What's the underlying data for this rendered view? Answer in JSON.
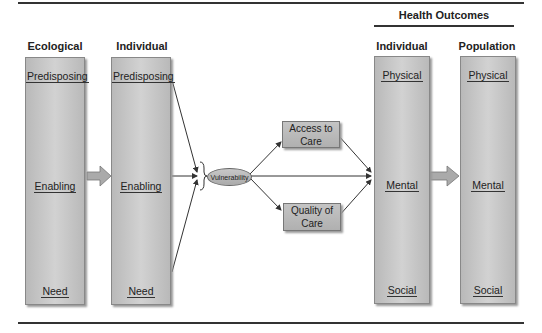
{
  "headers": {
    "health_outcomes": "Health Outcomes",
    "ecological": "Ecological",
    "individual_left": "Individual",
    "individual_right": "Individual",
    "population": "Population"
  },
  "columns": {
    "ecological": {
      "top": "Predisposing",
      "middle": "Enabling",
      "bottom": "Need"
    },
    "individual_left": {
      "top": "Predisposing",
      "middle": "Enabling",
      "bottom": "Need"
    },
    "individual_right": {
      "top": "Physical",
      "middle": "Mental",
      "bottom": "Social"
    },
    "population": {
      "top": "Physical",
      "middle": "Mental",
      "bottom": "Social"
    }
  },
  "nodes": {
    "vulnerability": "Vulnerability",
    "access_line1": "Access to",
    "access_line2": "Care",
    "quality_line1": "Quality of",
    "quality_line2": "Care"
  },
  "colors": {
    "column_fill": "#c4c4c4",
    "line": "#333333",
    "background": "#ffffff"
  }
}
